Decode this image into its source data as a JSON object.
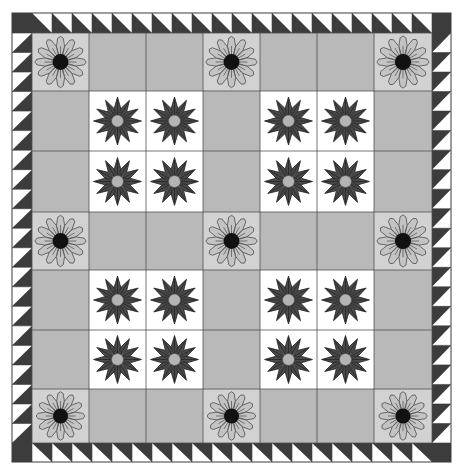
{
  "colors": {
    "background": "#ffffff",
    "border_dark": "#3c3c3c",
    "border_light": "#ffffff",
    "sashing": "#b9b9b9",
    "light_block_bg": "#d2d2d2",
    "light_petal": "#c4c4c4",
    "light_center": "#111111",
    "dark_block_bg": "#ffffff",
    "dark_petal": "#4a4a4a",
    "dark_center": "#b4b4b4",
    "seam": "#4c4c4c"
  },
  "geometry": {
    "outer": {
      "x0": 12,
      "y0": 13,
      "x1": 451,
      "y1": 462
    },
    "inner": {
      "x0": 32,
      "y0": 33,
      "x1": 432,
      "y1": 443
    },
    "col_edges": [
      32,
      89,
      146,
      203,
      260,
      317,
      374,
      432
    ],
    "row_edges": [
      33,
      91,
      151,
      212,
      270,
      330,
      389,
      443
    ],
    "border_top_count": 20,
    "border_side_count": 21
  },
  "blocks": {
    "light_flower_positions": [
      {
        "col": 0,
        "row": 0
      },
      {
        "col": 3,
        "row": 0
      },
      {
        "col": 6,
        "row": 0
      },
      {
        "col": 0,
        "row": 3
      },
      {
        "col": 3,
        "row": 3
      },
      {
        "col": 6,
        "row": 3
      },
      {
        "col": 0,
        "row": 6
      },
      {
        "col": 3,
        "row": 6
      },
      {
        "col": 6,
        "row": 6
      }
    ],
    "dark_flower_groups": [
      {
        "cols": [
          1,
          2
        ],
        "rows": [
          1,
          2
        ]
      },
      {
        "cols": [
          4,
          5
        ],
        "rows": [
          1,
          2
        ]
      },
      {
        "cols": [
          1,
          2
        ],
        "rows": [
          4,
          5
        ]
      },
      {
        "cols": [
          4,
          5
        ],
        "rows": [
          4,
          5
        ]
      }
    ],
    "petal_count": 12
  }
}
